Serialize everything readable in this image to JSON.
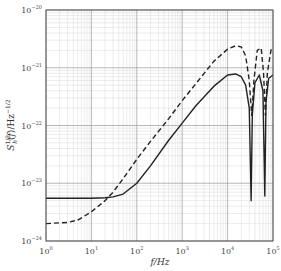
{
  "chart_data": {
    "type": "line",
    "title": "",
    "xlabel": "f/Hz",
    "ylabel": "S_h^{1/2}(f)/Hz^{-1/2}",
    "xscale": "log",
    "yscale": "log",
    "xlim": [
      1,
      100000
    ],
    "ylim": [
      1e-24,
      1e-20
    ],
    "grid": true,
    "grid_minor": true,
    "legend": null,
    "x_ticks": [
      {
        "base": "10",
        "exp": "0"
      },
      {
        "base": "10",
        "exp": "1"
      },
      {
        "base": "10",
        "exp": "2"
      },
      {
        "base": "10",
        "exp": "3"
      },
      {
        "base": "10",
        "exp": "4"
      },
      {
        "base": "10",
        "exp": "5"
      }
    ],
    "y_ticks": [
      {
        "base": "10",
        "exp": "−20"
      },
      {
        "base": "10",
        "exp": "−21"
      },
      {
        "base": "10",
        "exp": "−22"
      },
      {
        "base": "10",
        "exp": "−23"
      },
      {
        "base": "10",
        "exp": "−24"
      }
    ],
    "series": [
      {
        "name": "solid",
        "style": "solid",
        "color": "#222222",
        "x": [
          1,
          10,
          20,
          30,
          50,
          100,
          200,
          500,
          1000,
          2000,
          5000,
          10000,
          15000,
          20000,
          25000,
          30000,
          33000,
          35000,
          40000,
          50000,
          60000,
          66000,
          70000,
          80000,
          100000
        ],
        "values": [
          5.5e-24,
          5.5e-24,
          5.6e-24,
          5.8e-24,
          6.5e-24,
          1e-23,
          2e-23,
          5.5e-23,
          1.1e-22,
          2.2e-22,
          4.8e-22,
          7.5e-22,
          7.8e-22,
          7e-22,
          5e-22,
          2e-22,
          5e-24,
          1.5e-22,
          5.5e-22,
          7.5e-22,
          4e-22,
          6e-24,
          2.5e-22,
          6.5e-22,
          7.5e-22
        ]
      },
      {
        "name": "dashed",
        "style": "dashed",
        "color": "#222222",
        "x": [
          1,
          3,
          5,
          10,
          20,
          30,
          50,
          100,
          200,
          500,
          1000,
          2000,
          5000,
          10000,
          15000,
          20000,
          25000,
          30000,
          34000,
          38000,
          45000,
          55000,
          62000,
          68000,
          75000,
          90000,
          100000
        ],
        "values": [
          2e-24,
          2.1e-24,
          2.3e-24,
          3.2e-24,
          5e-24,
          7e-24,
          1.2e-23,
          2.6e-23,
          5.3e-23,
          1.3e-22,
          2.7e-22,
          5.3e-22,
          1.3e-21,
          2.1e-21,
          2.4e-21,
          2.3e-21,
          1.6e-21,
          6e-22,
          1.5e-22,
          6e-22,
          2e-21,
          2.2e-21,
          8e-22,
          1.5e-22,
          8e-22,
          2e-21,
          2.3e-21
        ]
      }
    ]
  }
}
